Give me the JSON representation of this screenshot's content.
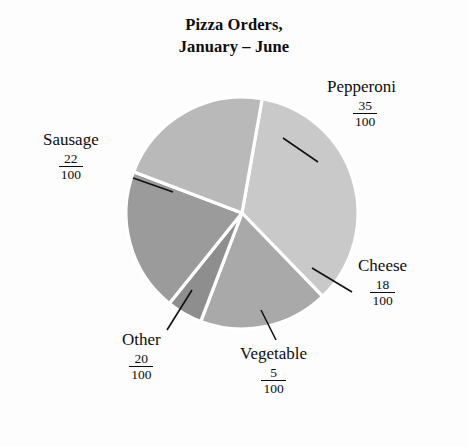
{
  "chart_data": {
    "type": "pie",
    "title": "Pizza Orders, January – June",
    "title_line1": "Pizza Orders,",
    "title_line2": "January – June",
    "total": 100,
    "denominator": 100,
    "categories": [
      "Pepperoni",
      "Cheese",
      "Vegetable",
      "Other",
      "Sausage"
    ],
    "values": [
      35,
      18,
      5,
      20,
      22
    ],
    "labels_as_fractions": [
      "35/100",
      "18/100",
      "5/100",
      "20/100",
      "22/100"
    ],
    "slices": [
      {
        "name": "Pepperoni",
        "value": 35,
        "numerator": "35",
        "denominator": "100",
        "color": "#c9c9c9",
        "start_angle": -80,
        "sweep": 126
      },
      {
        "name": "Cheese",
        "value": 18,
        "numerator": "18",
        "denominator": "100",
        "color": "#a9a9a9",
        "start_angle": 46,
        "sweep": 64.8
      },
      {
        "name": "Vegetable",
        "value": 5,
        "numerator": "5",
        "denominator": "100",
        "color": "#8e8e8e",
        "start_angle": 110.8,
        "sweep": 18
      },
      {
        "name": "Other",
        "value": 20,
        "numerator": "20",
        "denominator": "100",
        "color": "#9b9b9b",
        "start_angle": 128.8,
        "sweep": 72
      },
      {
        "name": "Sausage",
        "value": 22,
        "numerator": "22",
        "denominator": "100",
        "color": "#b9b9b9",
        "start_angle": 200.8,
        "sweep": 79.2
      }
    ],
    "legend": "none",
    "grid": false,
    "xlabel": "",
    "ylabel": "",
    "separator_color": "#ffffff",
    "background_color": "#fdfdfd",
    "text_color": "#0d0d0d"
  },
  "callouts": {
    "pepperoni": {
      "name": "Pepperoni",
      "num": "35",
      "den": "100"
    },
    "sausage": {
      "name": "Sausage",
      "num": "22",
      "den": "100"
    },
    "cheese": {
      "name": "Cheese",
      "num": "18",
      "den": "100"
    },
    "other": {
      "name": "Other",
      "num": "20",
      "den": "100"
    },
    "vegetable": {
      "name": "Vegetable",
      "num": "5",
      "den": "100"
    }
  }
}
